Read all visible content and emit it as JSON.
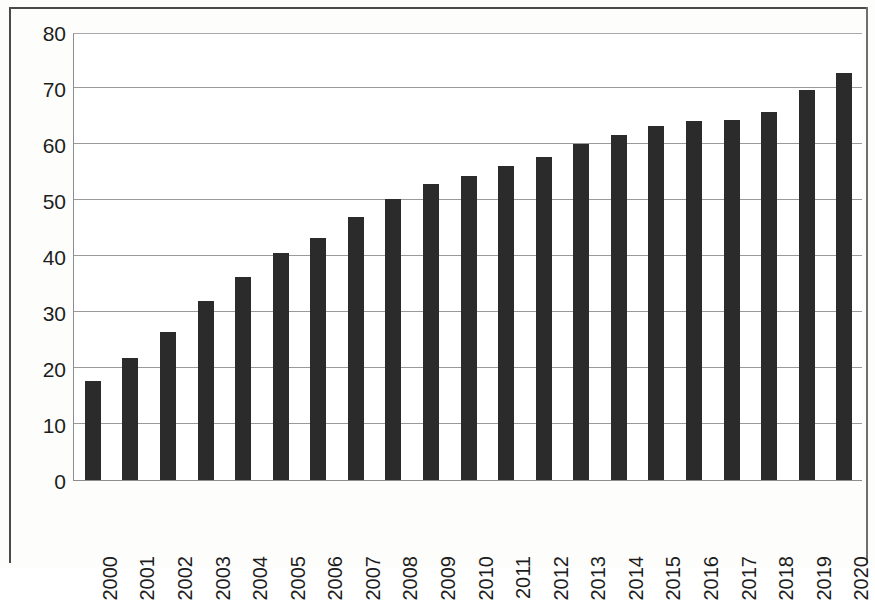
{
  "chart_data": {
    "type": "bar",
    "title": "",
    "subtitle": "",
    "xlabel": "",
    "ylabel": "",
    "ylim": [
      0,
      80
    ],
    "ytick_step": 10,
    "yticks": [
      "0",
      "10",
      "20",
      "30",
      "40",
      "50",
      "60",
      "70",
      "80"
    ],
    "grid": true,
    "legend": false,
    "legend_position": "none",
    "bar_color": "#2b2b2b",
    "plot_background": "#ffffff",
    "gridline_color": "#9a9a9a",
    "axis_color": "#8d8d8d",
    "categories": [
      "2000",
      "2001",
      "2002",
      "2003",
      "2004",
      "2005",
      "2006",
      "2007",
      "2008",
      "2009",
      "2010",
      "2011",
      "2012",
      "2013",
      "2014",
      "2015",
      "2016",
      "2017",
      "2018",
      "2019",
      "2020"
    ],
    "values": [
      17.6,
      21.8,
      26.5,
      32.0,
      36.2,
      40.6,
      43.3,
      47.0,
      50.2,
      52.8,
      54.2,
      56.1,
      57.7,
      60.0,
      61.6,
      63.2,
      64.1,
      64.2,
      65.7,
      69.7,
      72.6
    ],
    "series": [
      {
        "name": "",
        "values": [
          17.6,
          21.8,
          26.5,
          32.0,
          36.2,
          40.6,
          43.3,
          47.0,
          50.2,
          52.8,
          54.2,
          56.1,
          57.7,
          60.0,
          61.6,
          63.2,
          64.1,
          64.2,
          65.7,
          69.7,
          72.6
        ]
      }
    ]
  }
}
